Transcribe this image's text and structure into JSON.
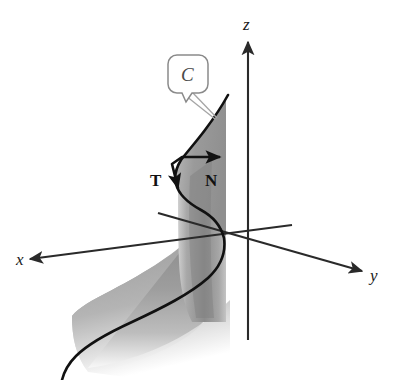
{
  "figure": {
    "background_color": "#ffffff",
    "width": 396,
    "height": 380
  },
  "axes": {
    "x": {
      "label": "x",
      "label_x": 16,
      "label_y": 265,
      "arrow_tip": [
        30,
        259
      ],
      "origin": [
        248,
        240
      ]
    },
    "y": {
      "label": "y",
      "label_x": 370,
      "label_y": 281,
      "arrow_tip": [
        362,
        271
      ],
      "origin": [
        248,
        240
      ]
    },
    "z": {
      "label": "z",
      "label_x": 243,
      "label_y": 30,
      "arrow_tip": [
        248,
        42
      ],
      "origin": [
        248,
        240
      ]
    },
    "axis_color": "#2a2a2a"
  },
  "vectors": [
    {
      "label": "T",
      "name": "unit-tangent-vector",
      "label_x": 152,
      "label_y": 185,
      "start": [
        182,
        157
      ],
      "tip": [
        178,
        192
      ],
      "color": "#111111"
    },
    {
      "label": "N",
      "name": "unit-normal-vector",
      "label_x": 207,
      "label_y": 185,
      "start": [
        182,
        157
      ],
      "tip": [
        222,
        157
      ],
      "color": "#111111"
    }
  ],
  "callout": {
    "label": "C",
    "name": "curve-label-callout",
    "box": {
      "x": 168,
      "y": 55,
      "width": 40,
      "height": 38,
      "radius": 9
    },
    "border_color": "#8a8a8a",
    "fill_color": "#ffffff",
    "leader_target": [
      215,
      118
    ]
  },
  "surface": {
    "name": "cylindrical-ribbon-surface",
    "fill_top": "#8e8e8e",
    "fill_mid": "#a3a3a3",
    "fill_bottom": "#ffffff",
    "cylinder_left_x": 178,
    "cylinder_right_x": 226
  },
  "curve": {
    "name": "space-curve-C",
    "color": "#111111",
    "stroke_width": 2.6,
    "top_point": [
      228,
      95
    ]
  }
}
